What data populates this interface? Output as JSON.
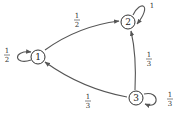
{
  "diagram": {
    "type": "markov-chain-state-diagram",
    "nodes": [
      {
        "id": "1",
        "label": "1",
        "cx": 38,
        "cy": 57
      },
      {
        "id": "2",
        "label": "2",
        "cx": 128,
        "cy": 22
      },
      {
        "id": "3",
        "label": "3",
        "cx": 136,
        "cy": 98
      }
    ],
    "edges": [
      {
        "from": "1",
        "to": "1",
        "label_num": "1",
        "label_den": "2"
      },
      {
        "from": "1",
        "to": "2",
        "label_num": "1",
        "label_den": "2"
      },
      {
        "from": "2",
        "to": "2",
        "label": "1"
      },
      {
        "from": "3",
        "to": "2",
        "label_num": "1",
        "label_den": "3"
      },
      {
        "from": "3",
        "to": "1",
        "label_num": "1",
        "label_den": "3"
      },
      {
        "from": "3",
        "to": "3",
        "label_num": "1",
        "label_den": "3"
      }
    ],
    "colors": {
      "stroke": "#555555",
      "text": "#222222",
      "background": "#ffffff"
    }
  }
}
